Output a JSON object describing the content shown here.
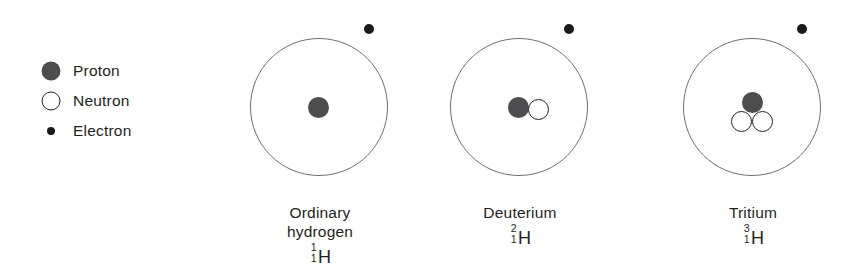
{
  "legend": {
    "items": [
      {
        "marker": "proton-marker",
        "label": "Proton"
      },
      {
        "marker": "neutron-marker",
        "label": "Neutron"
      },
      {
        "marker": "electron-marker",
        "label": "Electron"
      }
    ]
  },
  "atoms": [
    {
      "id": "ordinary-hydrogen",
      "name_line1": "Ordinary",
      "name_line2": "hydrogen",
      "symbol": "H",
      "mass_number": "1",
      "atomic_number": "1",
      "protons": 1,
      "neutrons": 0,
      "electrons": 1
    },
    {
      "id": "deuterium",
      "name_line1": "Deuterium",
      "name_line2": "",
      "symbol": "H",
      "mass_number": "2",
      "atomic_number": "1",
      "protons": 1,
      "neutrons": 1,
      "electrons": 1
    },
    {
      "id": "tritium",
      "name_line1": "Tritium",
      "name_line2": "",
      "symbol": "H",
      "mass_number": "3",
      "atomic_number": "1",
      "protons": 1,
      "neutrons": 2,
      "electrons": 1
    }
  ],
  "colors": {
    "proton_fill": "#4d4d4f",
    "neutron_fill": "#ffffff",
    "neutron_stroke": "#231f20",
    "electron_fill": "#1a1a1a",
    "orbit_stroke": "#6e6e70",
    "text": "#231f20",
    "background": "#ffffff"
  }
}
